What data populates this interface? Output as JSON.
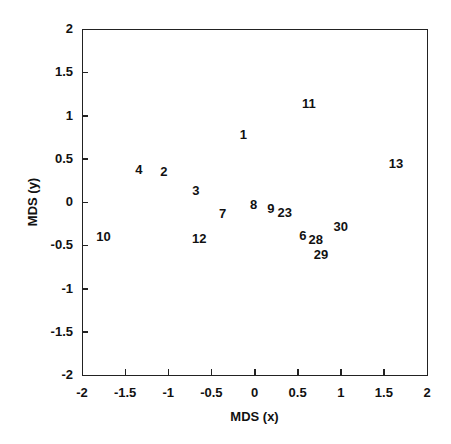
{
  "chart_data": {
    "type": "scatter",
    "title": "",
    "xlabel": "MDS (x)",
    "ylabel": "MDS (y)",
    "xlim": [
      -2,
      2
    ],
    "ylim": [
      -2,
      2
    ],
    "grid": false,
    "legend": null,
    "marker": "text-label",
    "x_ticks": [
      "-2",
      "-1.5",
      "-1",
      "-0.5",
      "0",
      "0.5",
      "1",
      "1.5",
      "2"
    ],
    "y_ticks": [
      "2",
      "1.5",
      "1",
      "0.5",
      "0",
      "-0.5",
      "-1",
      "-1.5",
      "-2"
    ],
    "points": [
      {
        "label": "1",
        "x": -0.13,
        "y": 0.77
      },
      {
        "label": "2",
        "x": -1.05,
        "y": 0.35
      },
      {
        "label": "3",
        "x": -0.68,
        "y": 0.13
      },
      {
        "label": "4",
        "x": -1.34,
        "y": 0.37
      },
      {
        "label": "6",
        "x": 0.56,
        "y": -0.39
      },
      {
        "label": "7",
        "x": -0.37,
        "y": -0.14
      },
      {
        "label": "8",
        "x": -0.01,
        "y": -0.03
      },
      {
        "label": "9",
        "x": 0.19,
        "y": -0.08
      },
      {
        "label": "10",
        "x": -1.75,
        "y": -0.41
      },
      {
        "label": "11",
        "x": 0.63,
        "y": 1.13
      },
      {
        "label": "12",
        "x": -0.64,
        "y": -0.43
      },
      {
        "label": "13",
        "x": 1.64,
        "y": 0.44
      },
      {
        "label": "23",
        "x": 0.35,
        "y": -0.13
      },
      {
        "label": "28",
        "x": 0.71,
        "y": -0.44
      },
      {
        "label": "29",
        "x": 0.77,
        "y": -0.61
      },
      {
        "label": "30",
        "x": 1.0,
        "y": -0.29
      }
    ]
  },
  "colors": {
    "background": "#ffffff",
    "axis": "#222222",
    "text": "#111111"
  }
}
